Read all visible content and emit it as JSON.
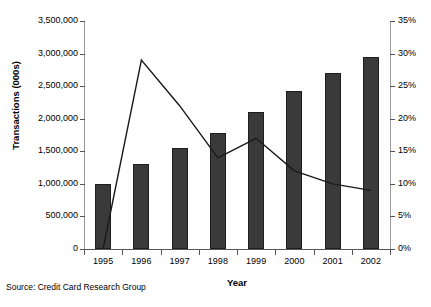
{
  "chart_data": {
    "type": "bar",
    "title": "",
    "subtitle": "",
    "xlabel": "Year",
    "ylabel": "Transactions (000s)",
    "y2label": "",
    "categories": [
      "1995",
      "1996",
      "1997",
      "1998",
      "1999",
      "2000",
      "2001",
      "2002"
    ],
    "series": [
      {
        "name": "Transactions (000s)",
        "type": "bar",
        "axis": "left",
        "values": [
          1000000,
          1300000,
          1550000,
          1780000,
          2100000,
          2420000,
          2700000,
          2950000
        ]
      },
      {
        "name": "Growth rate",
        "type": "line",
        "axis": "right",
        "values": [
          0,
          29,
          22,
          14,
          17,
          12,
          10,
          9
        ]
      }
    ],
    "ylim": [
      0,
      3500000
    ],
    "yticks": [
      0,
      500000,
      1000000,
      1500000,
      2000000,
      2500000,
      3000000,
      3500000
    ],
    "ytick_labels": [
      "0",
      "500,000",
      "1,000,000",
      "1,500,000",
      "2,000,000",
      "2,500,000",
      "3,000,000",
      "3,500,000"
    ],
    "y2lim": [
      0,
      35
    ],
    "y2ticks": [
      0,
      5,
      10,
      15,
      20,
      25,
      30,
      35
    ],
    "y2tick_labels": [
      "0%",
      "5%",
      "10%",
      "15%",
      "20%",
      "25%",
      "30%",
      "35%"
    ],
    "grid": false,
    "legend": "none",
    "annotations": [
      "Source: Credit Card Research Group"
    ],
    "colors": {
      "bar_fill": "#3a3a3a",
      "bar_stroke": "#1e1e1e",
      "line": "#1a1a1a",
      "axis": "#555555",
      "background": "#ffffff",
      "text": "#000000"
    }
  },
  "source_note": "Source: Credit Card Research Group"
}
